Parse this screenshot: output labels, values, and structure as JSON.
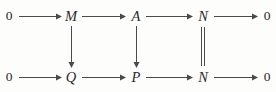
{
  "diagram": {
    "kind": "commutative-diagram",
    "ink_color": "#4a4a4a",
    "text_color": "#2b2b2b",
    "background_color": "#fdfdfc",
    "rows": [
      {
        "id": "top-row",
        "nodes": [
          {
            "id": "top-zero-left",
            "label": "0",
            "kind": "zero",
            "x": 9,
            "y": 16
          },
          {
            "id": "top-m",
            "label": "M",
            "kind": "var",
            "x": 71,
            "y": 16
          },
          {
            "id": "top-a",
            "label": "A",
            "kind": "var",
            "x": 136,
            "y": 16
          },
          {
            "id": "top-n",
            "label": "N",
            "kind": "var",
            "x": 203,
            "y": 16
          },
          {
            "id": "top-zero-right",
            "label": "0",
            "kind": "zero",
            "x": 267,
            "y": 16
          }
        ],
        "arrows": [
          {
            "id": "arrow-top-zero-to-m",
            "from": "0",
            "to": "M",
            "x": 19,
            "y": 16,
            "length": 42
          },
          {
            "id": "arrow-top-m-to-a",
            "from": "M",
            "to": "A",
            "x": 82,
            "y": 16,
            "length": 43
          },
          {
            "id": "arrow-top-a-to-n",
            "from": "A",
            "to": "N",
            "x": 146,
            "y": 16,
            "length": 46
          },
          {
            "id": "arrow-top-n-to-zero",
            "from": "N",
            "to": "0",
            "x": 214,
            "y": 16,
            "length": 43
          }
        ]
      },
      {
        "id": "bottom-row",
        "nodes": [
          {
            "id": "bottom-zero-left",
            "label": "0",
            "kind": "zero",
            "x": 9,
            "y": 77
          },
          {
            "id": "bottom-q",
            "label": "Q",
            "kind": "var",
            "x": 71,
            "y": 77
          },
          {
            "id": "bottom-p",
            "label": "P",
            "kind": "var",
            "x": 136,
            "y": 77
          },
          {
            "id": "bottom-n",
            "label": "N",
            "kind": "var",
            "x": 203,
            "y": 77
          },
          {
            "id": "bottom-zero-right",
            "label": "0",
            "kind": "zero",
            "x": 267,
            "y": 77
          }
        ],
        "arrows": [
          {
            "id": "arrow-bottom-zero-to-q",
            "from": "0",
            "to": "Q",
            "x": 19,
            "y": 77,
            "length": 42
          },
          {
            "id": "arrow-bottom-q-to-p",
            "from": "Q",
            "to": "P",
            "x": 82,
            "y": 77,
            "length": 43
          },
          {
            "id": "arrow-bottom-p-to-n",
            "from": "P",
            "to": "N",
            "x": 146,
            "y": 77,
            "length": 46
          },
          {
            "id": "arrow-bottom-n-to-zero",
            "from": "N",
            "to": "0",
            "x": 214,
            "y": 77,
            "length": 43
          }
        ]
      }
    ],
    "vertical_arrows": [
      {
        "id": "arrow-m-to-q",
        "from": "M",
        "to": "Q",
        "x": 71,
        "y": 26,
        "length": 41
      },
      {
        "id": "arrow-a-to-p",
        "from": "A",
        "to": "P",
        "x": 136,
        "y": 26,
        "length": 41
      }
    ],
    "identities": [
      {
        "id": "identity-n-to-n",
        "from": "N",
        "to": "N",
        "x": 203,
        "y": 27,
        "length": 39,
        "gap": 3
      }
    ]
  }
}
